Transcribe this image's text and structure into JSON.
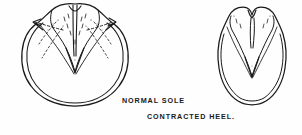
{
  "figure": {
    "background_color": "#fefefe",
    "ink_color": "#1a1a1a",
    "labels": {
      "normal_sole": "NORMAL SOLE",
      "contracted_heel": "CONTRACTED HEEL."
    },
    "diagrams": [
      {
        "id": "normal-sole",
        "name": "normal sole hoof diagram",
        "position": "left",
        "description": "Wide rounded hoof sole seen from below with double-line hoof wall, broad heels, V-shaped frog and dashed expansion arrows pointing outward to the quarters",
        "features": [
          "outer hoof wall",
          "inner hoof wall",
          "bulbs of heel",
          "central frog",
          "collateral grooves",
          "bars",
          "expansion arrows"
        ],
        "has_expansion_arrows": true
      },
      {
        "id": "contracted-heel",
        "name": "contracted heel hoof diagram",
        "position": "right",
        "description": "Narrow oval hoof sole with pinched bulbous heels drawn close together, shrunken frog and no outward expansion",
        "features": [
          "outer hoof wall",
          "inner hoof wall",
          "contracted bulbs of heel",
          "narrow frog",
          "collateral grooves"
        ],
        "has_expansion_arrows": false
      }
    ]
  }
}
